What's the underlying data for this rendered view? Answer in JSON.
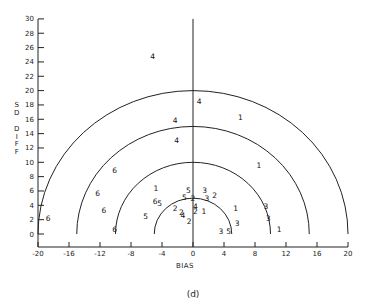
{
  "chart_data": {
    "type": "scatter",
    "title": "",
    "caption": "(d)",
    "xlabel": "BIAS",
    "ylabel": "SD DIFF",
    "xlim": [
      -20,
      20
    ],
    "ylim": [
      0,
      30
    ],
    "x_ticks": [
      -20,
      -16,
      -12,
      -8,
      -4,
      0,
      4,
      8,
      12,
      16,
      20
    ],
    "y_ticks": [
      0,
      2,
      4,
      6,
      8,
      10,
      12,
      14,
      16,
      18,
      20,
      22,
      24,
      26,
      28,
      30
    ],
    "grid": false,
    "reference_semicircles": {
      "center": [
        0,
        0
      ],
      "radii": [
        5,
        10,
        15,
        20
      ]
    },
    "vertical_reference_line": {
      "x": 0,
      "y_range": [
        0,
        30
      ]
    },
    "marker_style": "numeric labels (group id)",
    "points": [
      {
        "label": "6",
        "x": -18.7,
        "y": 2.1
      },
      {
        "label": "6",
        "x": -10.1,
        "y": 8.8
      },
      {
        "label": "6",
        "x": -12.3,
        "y": 5.6
      },
      {
        "label": "6",
        "x": -11.5,
        "y": 3.3
      },
      {
        "label": "6",
        "x": -10.1,
        "y": 0.6
      },
      {
        "label": "1",
        "x": -4.8,
        "y": 6.3
      },
      {
        "label": "6",
        "x": -4.9,
        "y": 4.6
      },
      {
        "label": "5",
        "x": -4.3,
        "y": 4.3
      },
      {
        "label": "5",
        "x": -6.1,
        "y": 2.4
      },
      {
        "label": "4",
        "x": -5.2,
        "y": 24.8
      },
      {
        "label": "4",
        "x": 0.8,
        "y": 18.5
      },
      {
        "label": "4",
        "x": -2.3,
        "y": 15.8
      },
      {
        "label": "4",
        "x": -2.1,
        "y": 13.0
      },
      {
        "label": "1",
        "x": 6.1,
        "y": 16.2
      },
      {
        "label": "1",
        "x": 8.5,
        "y": 9.5
      },
      {
        "label": "5",
        "x": -0.6,
        "y": 6.1
      },
      {
        "label": "5",
        "x": -1.1,
        "y": 5.1
      },
      {
        "label": "2",
        "x": 0.0,
        "y": 5.0
      },
      {
        "label": "3",
        "x": 1.5,
        "y": 6.1
      },
      {
        "label": "3",
        "x": 1.8,
        "y": 5.0
      },
      {
        "label": "2",
        "x": 2.8,
        "y": 5.4
      },
      {
        "label": "2",
        "x": -2.3,
        "y": 3.6
      },
      {
        "label": "2",
        "x": -1.5,
        "y": 3.0
      },
      {
        "label": "4",
        "x": -1.3,
        "y": 2.6
      },
      {
        "label": "4",
        "x": 0.3,
        "y": 3.8
      },
      {
        "label": "2",
        "x": 0.3,
        "y": 3.1
      },
      {
        "label": "1",
        "x": 1.4,
        "y": 3.2
      },
      {
        "label": "2",
        "x": -0.5,
        "y": 1.7
      },
      {
        "label": "1",
        "x": 5.5,
        "y": 3.6
      },
      {
        "label": "3",
        "x": 5.7,
        "y": 1.5
      },
      {
        "label": "3",
        "x": 3.6,
        "y": 0.4
      },
      {
        "label": "5",
        "x": 4.6,
        "y": 0.4
      },
      {
        "label": "3",
        "x": 9.4,
        "y": 3.8
      },
      {
        "label": "3",
        "x": 9.7,
        "y": 2.2
      },
      {
        "label": "1",
        "x": 11.1,
        "y": 0.6
      }
    ]
  },
  "layout": {
    "plot_origin_px": [
      193,
      234
    ],
    "px_per_unit_x": 7.75,
    "px_per_unit_y": 7.17,
    "x_axis_px_y": 247,
    "y_axis_px_x": 38,
    "line_color": "#222222"
  }
}
